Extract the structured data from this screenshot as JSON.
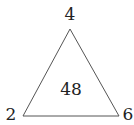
{
  "diagram": {
    "shape": "triangle",
    "vertices": {
      "top": "4",
      "bottom_left": "2",
      "bottom_right": "6"
    },
    "center": "48",
    "stroke_color": "#555555",
    "text_color": "#222222"
  }
}
